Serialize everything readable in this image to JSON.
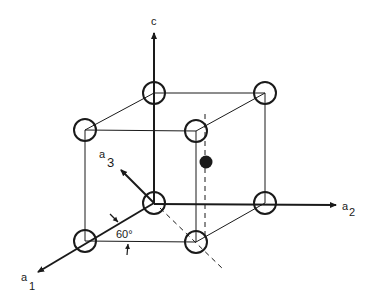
{
  "diagram": {
    "type": "hexagonal-unit-cell",
    "axes": {
      "c": {
        "label": "c"
      },
      "a1": {
        "label": "a",
        "sub": "1"
      },
      "a2": {
        "label": "a",
        "sub": "2"
      },
      "a3": {
        "label": "a",
        "sub": "3"
      }
    },
    "angle_label": "60°",
    "colors": {
      "ink": "#1a1a1a",
      "background": "#ffffff"
    },
    "atoms": {
      "open_corner_count": 8,
      "filled_interior_count": 1
    }
  }
}
